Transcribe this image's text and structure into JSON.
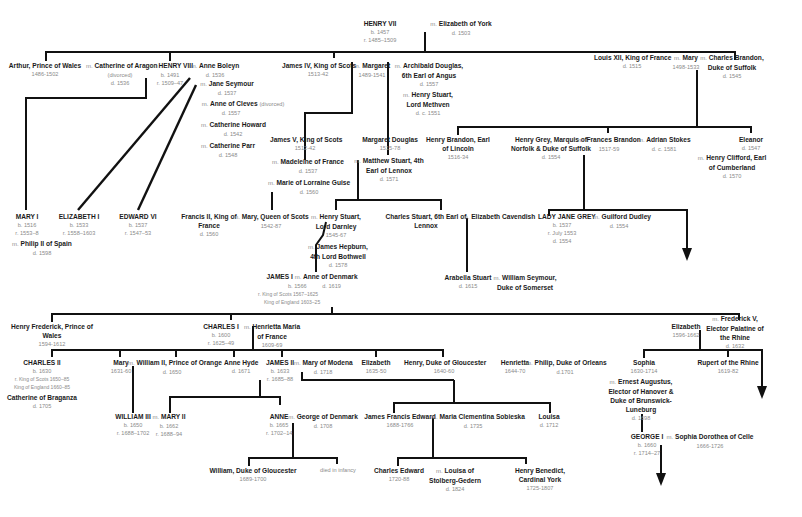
{
  "diagram": {
    "type": "family-tree",
    "marriage_symbol": "m.",
    "people": {
      "henry7": {
        "name": "HENRY VII",
        "dates": [
          "b. 1457",
          "r. 1485–1509"
        ]
      },
      "eliz_york": {
        "name": "Elizabeth of York",
        "dates": [
          "d. 1503"
        ]
      },
      "arthur": {
        "name": "Arthur, Prince of Wales",
        "dates": [
          "1486-1502"
        ]
      },
      "cath_aragon": {
        "name": "Catherine of Aragon",
        "dates": [
          "(divorced)",
          "d. 1536"
        ]
      },
      "henry8": {
        "name": "HENRY VIII",
        "dates": [
          "b. 1491",
          "r. 1509–47"
        ]
      },
      "anne_boleyn": {
        "name": "Anne Boleyn",
        "dates": [
          "d. 1536"
        ]
      },
      "jane_seymour": {
        "name": "Jane Seymour",
        "dates": [
          "d. 1537"
        ]
      },
      "anne_cleves": {
        "name": "Anne of Cleves",
        "note": "(divorced)",
        "dates": [
          "d. 1557"
        ]
      },
      "cath_howard": {
        "name": "Catherine Howard",
        "dates": [
          "d. 1542"
        ]
      },
      "cath_parr": {
        "name": "Catherine Parr",
        "dates": [
          "d. 1548"
        ]
      },
      "james4": {
        "name": "James IV, King of Scots",
        "dates": [
          "1513-42"
        ]
      },
      "margaret": {
        "name": "Margaret",
        "dates": [
          "1489-1541"
        ]
      },
      "archibald": {
        "name": "Archibald Douglas, 6th Earl of Angus",
        "dates": [
          "d. 1557"
        ]
      },
      "henry_stuart_methven": {
        "name": "Henry Stuart, Lord Methven",
        "dates": [
          "d. c. 1551"
        ]
      },
      "louis12": {
        "name": "Louis XII, King of France",
        "dates": [
          "d. 1515"
        ]
      },
      "mary_tudor": {
        "name": "Mary",
        "dates": [
          "1498-1533"
        ]
      },
      "charles_brandon": {
        "name": "Charles Brandon, Duke of Suffolk",
        "dates": [
          "d. 1545"
        ]
      },
      "mary1": {
        "name": "MARY I",
        "dates": [
          "b. 1516",
          "r. 1553–8"
        ]
      },
      "philip2": {
        "name": "Philip II of Spain",
        "dates": [
          "d. 1598"
        ]
      },
      "elizabeth1": {
        "name": "ELIZABETH I",
        "dates": [
          "b. 1533",
          "r. 1558–1603"
        ]
      },
      "edward6": {
        "name": "EDWARD VI",
        "dates": [
          "b. 1537",
          "r. 1547–53"
        ]
      },
      "james5": {
        "name": "James V, King of Scots",
        "dates": [
          "1512-42"
        ]
      },
      "madeleine": {
        "name": "Madeleine of France",
        "dates": [
          "d. 1537"
        ]
      },
      "marie_guise": {
        "name": "Marie of Lorraine Guise",
        "dates": [
          "d. 1560"
        ]
      },
      "margaret_douglas": {
        "name": "Margaret Douglas",
        "dates": [
          "1515-78"
        ]
      },
      "matthew_stuart": {
        "name": "Matthew Stuart, 4th Earl of Lennox",
        "dates": [
          "d. 1571"
        ]
      },
      "henry_brandon": {
        "name": "Henry Brandon, Earl of Lincoln",
        "dates": [
          "1516-34"
        ]
      },
      "henry_grey": {
        "name": "Henry Grey, Marquis of Norfolk & Duke of Suffolk",
        "dates": [
          "d. 1554"
        ]
      },
      "frances_brandon": {
        "name": "Frances Brandon",
        "dates": [
          "1517-59"
        ]
      },
      "adrian_stokes": {
        "name": "Adrian Stokes",
        "dates": [
          "d. c. 1581"
        ]
      },
      "eleanor": {
        "name": "Eleanor",
        "dates": [
          "d. 1547"
        ]
      },
      "henry_clifford": {
        "name": "Henry Clifford, Earl of Cumberland",
        "dates": [
          "d. 1570"
        ]
      },
      "francis2": {
        "name": "Francis II, King of France",
        "dates": [
          "d. 1560"
        ]
      },
      "mary_scots": {
        "name": "Mary, Queen of Scots",
        "dates": [
          "1542-87"
        ]
      },
      "darnley": {
        "name": "Henry Stuart, Lord Darnley",
        "dates": [
          "1545-67"
        ]
      },
      "bothwell": {
        "name": "James Hepburn, 4th Lord Bothwell",
        "dates": [
          "d. 1578"
        ]
      },
      "charles_stuart": {
        "name": "Charles Stuart, 6th Earl of Lennox",
        "dates": []
      },
      "eliz_cavendish": {
        "name": "Elizabeth Cavendish",
        "dates": []
      },
      "jane_grey": {
        "name": "LADY JANE GREY",
        "dates": [
          "b. 1537",
          "r. July 1553",
          "d. 1554"
        ]
      },
      "guilford": {
        "name": "Guilford Dudley",
        "dates": [
          "d. 1554"
        ]
      },
      "james1": {
        "name": "JAMES I",
        "dates": [
          "b. 1566",
          "r. King of Scots 1567–1625",
          "King of England 1603–25"
        ]
      },
      "anne_denmark": {
        "name": "Anne of Denmark",
        "dates": [
          "d. 1619"
        ]
      },
      "arabella": {
        "name": "Arabella Stuart",
        "dates": [
          "d. 1615"
        ]
      },
      "william_seymour": {
        "name": "William Seymour, Duke of Somerset",
        "dates": []
      },
      "henry_frederick": {
        "name": "Henry Frederick, Prince of Wales",
        "dates": [
          "1594-1612"
        ]
      },
      "charles1": {
        "name": "CHARLES I",
        "dates": [
          "b. 1600",
          "r. 1625–49"
        ]
      },
      "henrietta_maria": {
        "name": "Henrietta Maria of France",
        "dates": [
          "1609-69"
        ]
      },
      "elizabeth_bohemia": {
        "name": "Elizabeth",
        "dates": [
          "1596-1662"
        ]
      },
      "frederick5": {
        "name": "Frederick V, Elector Palatine of the Rhine",
        "dates": [
          "d. 1632"
        ]
      },
      "charles2": {
        "name": "CHARLES II",
        "dates": [
          "b. 1630",
          "r. King of Scots 1650–85",
          "King of England 1660–85"
        ]
      },
      "cath_braganza": {
        "name": "Catherine of Braganza",
        "dates": [
          "d. 1705"
        ]
      },
      "mary_orange": {
        "name": "Mary",
        "dates": [
          "1631-60"
        ]
      },
      "william2": {
        "name": "William II, Prince of Orange",
        "dates": [
          "d. 1650"
        ]
      },
      "anne_hyde": {
        "name": "Anne Hyde",
        "dates": [
          "d. 1671"
        ]
      },
      "james2": {
        "name": "JAMES II",
        "dates": [
          "b. 1633",
          "r. 1685–88"
        ]
      },
      "mary_modena": {
        "name": "Mary of Modena",
        "dates": [
          "d. 1718"
        ]
      },
      "elizabeth_c1": {
        "name": "Elizabeth",
        "dates": [
          "1635-50"
        ]
      },
      "henry_gloucester": {
        "name": "Henry, Duke of Gloucester",
        "dates": [
          "1640-60"
        ]
      },
      "henrietta": {
        "name": "Henrietta",
        "dates": [
          "1644-70"
        ]
      },
      "philip_orleans": {
        "name": "Philip, Duke of Orleans",
        "dates": [
          "d.1701"
        ]
      },
      "sophia": {
        "name": "Sophia",
        "dates": [
          "1630-1714"
        ]
      },
      "ernest_augustus": {
        "name": "Ernest Augustus, Elector of Hanover & Duke of Brunswick-Luneburg",
        "dates": [
          "d. 1698"
        ]
      },
      "rupert": {
        "name": "Rupert of the Rhine",
        "dates": [
          "1619-82"
        ]
      },
      "william3": {
        "name": "WILLIAM III",
        "dates": [
          "b. 1650",
          "r. 1688–1702"
        ]
      },
      "mary2": {
        "name": "MARY II",
        "dates": [
          "b. 1662",
          "r. 1688–94"
        ]
      },
      "anne": {
        "name": "ANNE",
        "dates": [
          "b. 1665",
          "r. 1702–14"
        ]
      },
      "george_denmark": {
        "name": "George of Denmark",
        "dates": [
          "d. 1708"
        ]
      },
      "james_francis": {
        "name": "James Francis Edward",
        "dates": [
          "1688-1766"
        ]
      },
      "maria_sobieska": {
        "name": "Maria Clementina Sobieska",
        "dates": [
          "d. 1735"
        ]
      },
      "louisa": {
        "name": "Louisa",
        "dates": [
          "d. 1712"
        ]
      },
      "george1": {
        "name": "GEORGE I",
        "dates": [
          "b. 1660",
          "r. 1714–27"
        ]
      },
      "sophia_dorothea": {
        "name": "Sophia Dorothea of Celle",
        "dates": [
          "1666-1726"
        ]
      },
      "william_gloucester": {
        "name": "William, Duke of Gloucester",
        "dates": [
          "1689-1700"
        ]
      },
      "died_infancy": {
        "name": "died in infancy"
      },
      "charles_edward": {
        "name": "Charles Edward",
        "dates": [
          "1720-88"
        ]
      },
      "louisa_stolberg": {
        "name": "Louisa of Stolberg-Gedern",
        "dates": [
          "d. 1824"
        ]
      },
      "henry_benedict": {
        "name": "Henry Benedict, Cardinal York",
        "dates": [
          "1725-1807"
        ]
      }
    },
    "colors": {
      "line": "#111111",
      "name_text": "#1a1a1a",
      "date_text": "#8a8a8a",
      "background": "#ffffff"
    }
  }
}
